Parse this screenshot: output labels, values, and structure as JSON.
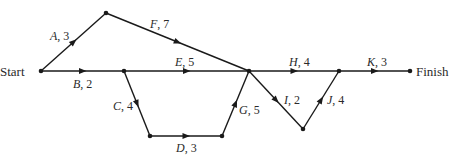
{
  "diagram": {
    "type": "activity-network",
    "start_label": "Start",
    "finish_label": "Finish",
    "nodes": [
      {
        "id": "start",
        "x": 41,
        "y": 71
      },
      {
        "id": "n1",
        "x": 106,
        "y": 13
      },
      {
        "id": "n2",
        "x": 124,
        "y": 71
      },
      {
        "id": "n3",
        "x": 150,
        "y": 136
      },
      {
        "id": "n4",
        "x": 222,
        "y": 136
      },
      {
        "id": "n5",
        "x": 249,
        "y": 71
      },
      {
        "id": "n6",
        "x": 303,
        "y": 129
      },
      {
        "id": "n7",
        "x": 339,
        "y": 71
      },
      {
        "id": "finish",
        "x": 410,
        "y": 71
      }
    ],
    "activities": [
      {
        "name": "A",
        "duration": "3",
        "from": "start",
        "to": "n1"
      },
      {
        "name": "B",
        "duration": "2",
        "from": "start",
        "to": "n2"
      },
      {
        "name": "C",
        "duration": "4",
        "from": "n2",
        "to": "n3"
      },
      {
        "name": "D",
        "duration": "3",
        "from": "n3",
        "to": "n4"
      },
      {
        "name": "E",
        "duration": "5",
        "from": "n2",
        "to": "n5"
      },
      {
        "name": "F",
        "duration": "7",
        "from": "n1",
        "to": "n5"
      },
      {
        "name": "G",
        "duration": "5",
        "from": "n4",
        "to": "n5"
      },
      {
        "name": "H",
        "duration": "4",
        "from": "n5",
        "to": "n7"
      },
      {
        "name": "I",
        "duration": "2",
        "from": "n5",
        "to": "n6"
      },
      {
        "name": "J",
        "duration": "4",
        "from": "n6",
        "to": "n7"
      },
      {
        "name": "K",
        "duration": "3",
        "from": "n7",
        "to": "finish"
      }
    ]
  }
}
